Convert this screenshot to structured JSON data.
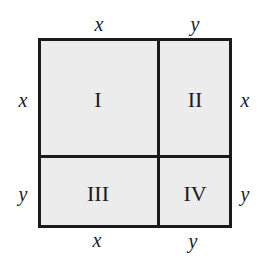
{
  "diagram": {
    "type": "area-model-square",
    "colors": {
      "fill": "#ececec",
      "stroke": "#1a1a1a",
      "background": "#ffffff"
    },
    "top_labels": [
      "x",
      "y"
    ],
    "bottom_labels": [
      "x",
      "y"
    ],
    "left_labels": [
      "x",
      "y"
    ],
    "right_labels": [
      "x",
      "y"
    ],
    "regions": [
      {
        "id": "I",
        "label": "I",
        "width": "x",
        "height": "x"
      },
      {
        "id": "II",
        "label": "II",
        "width": "y",
        "height": "x"
      },
      {
        "id": "III",
        "label": "III",
        "width": "x",
        "height": "y"
      },
      {
        "id": "IV",
        "label": "IV",
        "width": "y",
        "height": "y"
      }
    ]
  }
}
